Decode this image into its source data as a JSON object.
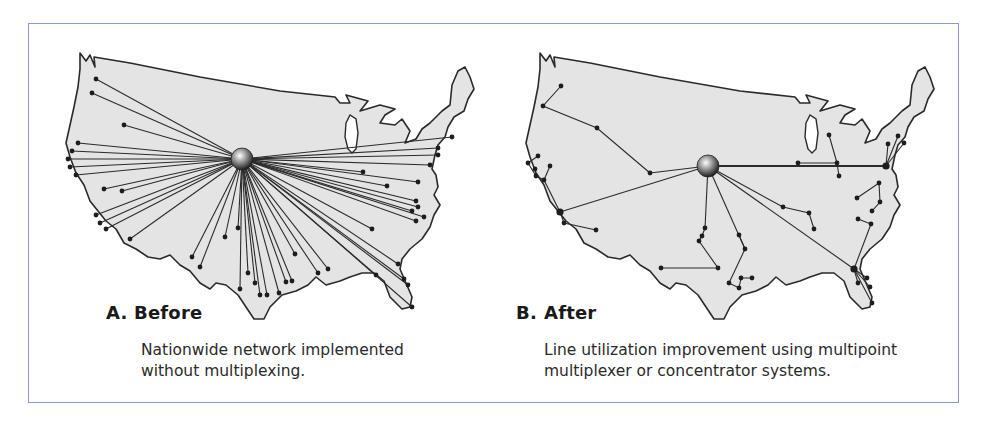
{
  "figure": {
    "border_color": "#8d97dc",
    "panels": [
      {
        "id": "A",
        "letter": "A.",
        "title": "Before",
        "caption_line1": "Nationwide network implemented",
        "caption_line2": "without multiplexing.",
        "topology": "star",
        "hub": "central-hub-sphere"
      },
      {
        "id": "B",
        "letter": "B.",
        "title": "After",
        "caption_line1": "Line utilization improvement using multipoint",
        "caption_line2": "multiplexer or concentrator systems.",
        "topology": "multipoint-tree",
        "hub": "central-hub-sphere"
      }
    ]
  }
}
